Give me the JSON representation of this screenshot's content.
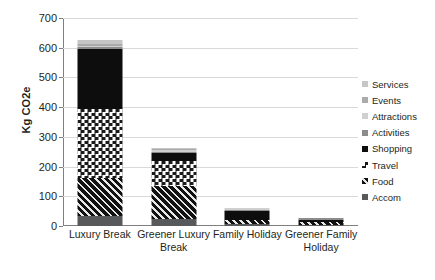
{
  "chart_data": {
    "type": "bar",
    "subtype": "stacked-vertical",
    "title": "",
    "xlabel": "",
    "ylabel": "Kg CO2e",
    "ylim": [
      0,
      700
    ],
    "ytick_step": 100,
    "yticks": [
      0,
      100,
      200,
      300,
      400,
      500,
      600,
      700
    ],
    "grid": "horizontal",
    "legend_position": "right",
    "categories": [
      "Luxury Break",
      "Greener Luxury Break",
      "Family Holiday",
      "Greener Family Holiday"
    ],
    "series": [
      {
        "name": "Accom",
        "color": "#58595b",
        "pattern": "solid-grey",
        "values": [
          35,
          25,
          8,
          4
        ]
      },
      {
        "name": "Food",
        "color": "#111111",
        "pattern": "diagonal-hatch",
        "values": [
          125,
          110,
          12,
          8
        ]
      },
      {
        "name": "Travel",
        "color": "#1a1a1a",
        "pattern": "checkerboard",
        "values": [
          235,
          85,
          0,
          0
        ]
      },
      {
        "name": "Shopping",
        "color": "#0d0d0d",
        "pattern": "solid-black",
        "values": [
          200,
          25,
          30,
          9
        ]
      },
      {
        "name": "Activities",
        "color": "#8c8c8c",
        "pattern": "solid-grey",
        "values": [
          6,
          3,
          2,
          1
        ]
      },
      {
        "name": "Attractions",
        "color": "#d0d0d0",
        "pattern": "light-grey",
        "values": [
          6,
          2,
          1,
          0
        ]
      },
      {
        "name": "Events",
        "color": "#ababab",
        "pattern": "mid-grey",
        "values": [
          5,
          2,
          0,
          0
        ]
      },
      {
        "name": "Services",
        "color": "#c6c6c6",
        "pattern": "pale-grey",
        "values": [
          13,
          3,
          0,
          0
        ]
      }
    ],
    "totals": [
      625,
      255,
      53,
      22
    ],
    "legend_order_top_to_bottom": [
      "Services",
      "Events",
      "Attractions",
      "Activities",
      "Shopping",
      "Travel",
      "Food",
      "Accom"
    ]
  }
}
